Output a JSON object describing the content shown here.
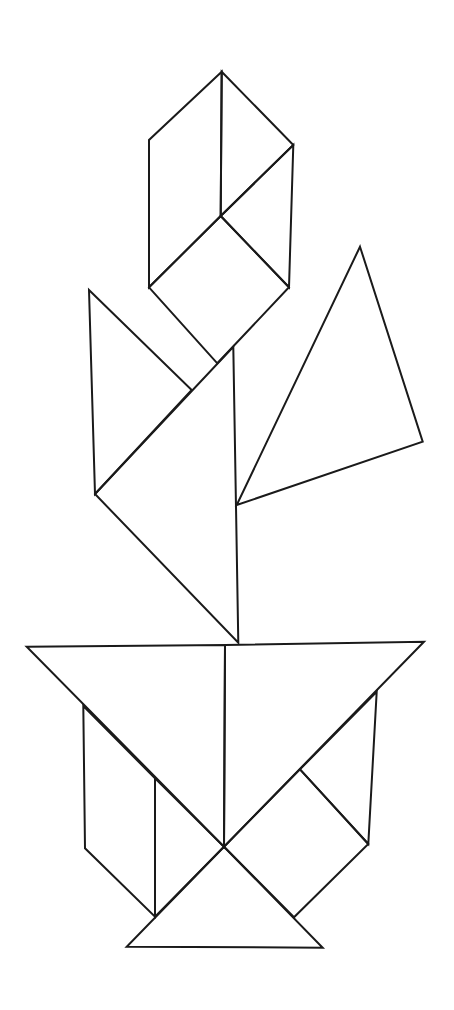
{
  "figure": {
    "title": "Tangram figure: flower in a pot",
    "width": 454,
    "height": 1010,
    "background": "#ffffff",
    "stroke": "#1a1a1a",
    "stroke_width": 2
  },
  "shapes": [
    {
      "name": "flower-top-left-rhombus",
      "points": [
        [
          221.7,
          71.7
        ],
        [
          149,
          140
        ],
        [
          149,
          287.3
        ],
        [
          220.7,
          216
        ]
      ]
    },
    {
      "name": "flower-top-right-rhombus",
      "points": [
        [
          221.7,
          71.7
        ],
        [
          293.3,
          145
        ],
        [
          220.7,
          216
        ]
      ]
    },
    {
      "name": "flower-right-parallelogram",
      "points": [
        [
          293.3,
          145
        ],
        [
          289,
          287.3
        ],
        [
          220.7,
          216
        ]
      ]
    },
    {
      "name": "flower-square",
      "points": [
        [
          220.7,
          216
        ],
        [
          289,
          287.3
        ],
        [
          217.3,
          363.3
        ],
        [
          149,
          287.3
        ]
      ]
    },
    {
      "name": "leaf-left-triangle",
      "points": [
        [
          89,
          290
        ],
        [
          191.7,
          390
        ],
        [
          95,
          494
        ]
      ]
    },
    {
      "name": "stem-big-triangle",
      "points": [
        [
          233.3,
          346.7
        ],
        [
          238.3,
          642.7
        ],
        [
          95,
          494
        ]
      ]
    },
    {
      "name": "leaf-right-triangle",
      "points": [
        [
          360,
          246.7
        ],
        [
          422.7,
          441.7
        ],
        [
          236.7,
          505
        ]
      ]
    },
    {
      "name": "pot-rim-left-triangle",
      "points": [
        [
          26.7,
          646.7
        ],
        [
          225,
          645
        ],
        [
          224,
          846.7
        ]
      ]
    },
    {
      "name": "pot-rim-right-triangle",
      "points": [
        [
          225,
          645
        ],
        [
          424,
          641.7
        ],
        [
          224,
          846.7
        ]
      ]
    },
    {
      "name": "pot-left-parallelogram",
      "points": [
        [
          83.3,
          706
        ],
        [
          155,
          778.3
        ],
        [
          155,
          916.7
        ],
        [
          85,
          848.3
        ]
      ]
    },
    {
      "name": "pot-left-small-triangle",
      "points": [
        [
          155,
          778.3
        ],
        [
          224,
          846.7
        ],
        [
          155,
          916.7
        ]
      ]
    },
    {
      "name": "pot-right-small-triangle",
      "points": [
        [
          376.7,
          691.7
        ],
        [
          368.3,
          844
        ],
        [
          300,
          769.3
        ]
      ]
    },
    {
      "name": "pot-right-square",
      "points": [
        [
          300,
          769.3
        ],
        [
          368.3,
          844
        ],
        [
          294,
          917.3
        ],
        [
          224,
          846.7
        ]
      ]
    },
    {
      "name": "pot-base-triangle",
      "points": [
        [
          224,
          846.7
        ],
        [
          322.7,
          947.7
        ],
        [
          126.7,
          946.7
        ]
      ]
    }
  ]
}
